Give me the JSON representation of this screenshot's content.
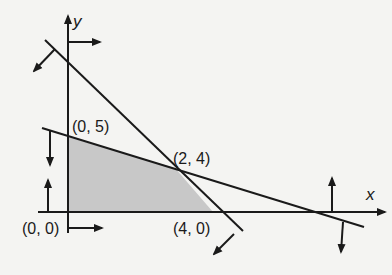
{
  "diagram": {
    "type": "linear-programming-feasible-region",
    "axes": {
      "x_label": "x",
      "y_label": "y"
    },
    "vertices": [
      {
        "label": "(0, 0)",
        "x": 0,
        "y": 0
      },
      {
        "label": "(0, 5)",
        "x": 0,
        "y": 5
      },
      {
        "label": "(2, 4)",
        "x": 2,
        "y": 4
      },
      {
        "label": "(4, 0)",
        "x": 4,
        "y": 0
      }
    ],
    "constraint_lines": [
      {
        "name": "line-through-2-4-and-4-0",
        "arrow_direction": "down-left"
      },
      {
        "name": "line-through-0-5-and-2-4",
        "arrow_direction": "down"
      }
    ],
    "axis_constraints": [
      {
        "name": "x-nonnegative",
        "arrow_direction": "right"
      },
      {
        "name": "y-nonnegative",
        "arrow_direction": "up"
      }
    ],
    "colors": {
      "feasible_region": "#c8c8c8",
      "line": "#1a1a1a",
      "background": "#f4f4f2"
    }
  }
}
